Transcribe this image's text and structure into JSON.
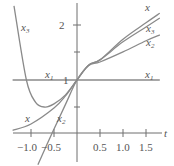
{
  "chart_data": {
    "type": "line",
    "title": "",
    "xlabel": "t",
    "ylabel": "",
    "xlim": [
      -1.4,
      1.8
    ],
    "ylim": [
      -0.6,
      2.45
    ],
    "grid": false,
    "legend": "inline labels",
    "x_ticks": [
      -1.0,
      -0.5,
      0.5,
      1.0,
      1.5
    ],
    "x_tick_labels": [
      "−1.0",
      "−0.5",
      "0.5",
      "1.0",
      "1.5"
    ],
    "y_ticks": [
      0.5,
      1,
      1.5,
      2
    ],
    "y_tick_labels": [
      "",
      "1",
      "",
      "2"
    ],
    "series": [
      {
        "name": "x",
        "points": [
          [
            -1.4,
            0.05
          ],
          [
            -1.0,
            0.17
          ],
          [
            -0.5,
            0.47
          ],
          [
            -0.25,
            0.7
          ],
          [
            0,
            1
          ],
          [
            0.25,
            1.28
          ],
          [
            0.5,
            1.38
          ],
          [
            1.0,
            1.77
          ],
          [
            1.5,
            2.08
          ],
          [
            1.8,
            2.26
          ]
        ]
      },
      {
        "name": "x1",
        "points": [
          [
            -1.4,
            1
          ],
          [
            1.8,
            1
          ]
        ]
      },
      {
        "name": "x2",
        "points": [
          [
            -0.85,
            -0.6
          ],
          [
            -0.54,
            0
          ],
          [
            -0.25,
            0.54
          ],
          [
            0,
            1
          ],
          [
            0.25,
            1.27
          ],
          [
            0.5,
            1.34
          ],
          [
            1.0,
            1.53
          ],
          [
            1.5,
            1.74
          ],
          [
            1.8,
            1.85
          ]
        ]
      },
      {
        "name": "x3",
        "points": [
          [
            -1.37,
            2.4
          ],
          [
            -1.1,
            1.0
          ],
          [
            -0.9,
            0.58
          ],
          [
            -0.7,
            0.49
          ],
          [
            -0.5,
            0.55
          ],
          [
            -0.25,
            0.72
          ],
          [
            0,
            1
          ],
          [
            0.25,
            1.28
          ],
          [
            0.5,
            1.38
          ],
          [
            1.0,
            1.72
          ],
          [
            1.5,
            2.0
          ],
          [
            1.8,
            2.17
          ]
        ]
      }
    ],
    "annotations": [
      {
        "text": "x3",
        "t": -1.25,
        "y": 1.95
      },
      {
        "text": "x1",
        "t": -0.75,
        "y": 1.07
      },
      {
        "text": "x1",
        "t": 1.55,
        "y": 1.07
      },
      {
        "text": "x",
        "t": 1.45,
        "y": 2.3
      },
      {
        "text": "x3",
        "t": 1.5,
        "y": 1.85
      },
      {
        "text": "x2",
        "t": 1.5,
        "y": 1.58
      },
      {
        "text": "x",
        "t": -1.05,
        "y": 0.2
      },
      {
        "text": "x2",
        "t": -0.35,
        "y": 0.2
      }
    ]
  },
  "labels": {
    "t_axis": "t",
    "y_tick_1": "1",
    "y_tick_2": "2",
    "xt_m10": "−1.0",
    "xt_m05": "−0.5",
    "xt_05": "0.5",
    "xt_10": "1.0",
    "xt_15": "1.5",
    "series_x": "x",
    "series_x1": "x",
    "series_x2": "x",
    "series_x3": "x",
    "sub_1": "1",
    "sub_2": "2",
    "sub_3": "3"
  }
}
